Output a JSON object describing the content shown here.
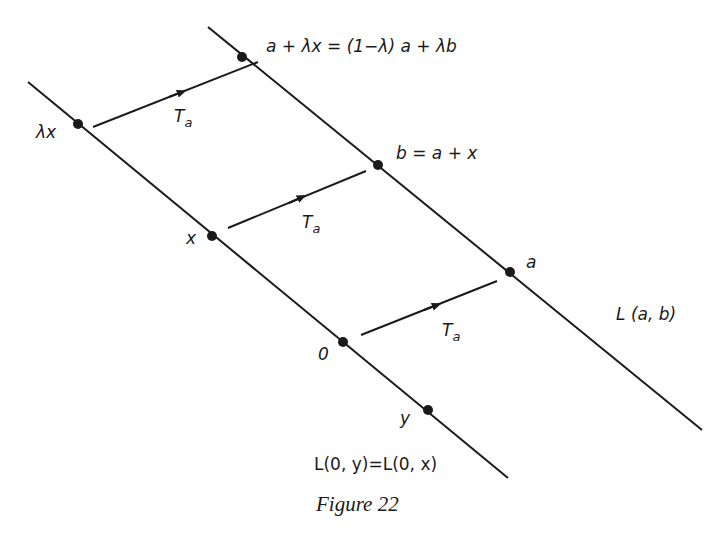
{
  "diagram": {
    "caption": "Figure 22",
    "colors": {
      "ink": "#1a1a1a",
      "background": "#ffffff"
    },
    "lines": [
      {
        "id": "line-0x",
        "label": "L(0,y)=L(0,x)",
        "from": [
          28,
          82
        ],
        "to": [
          508,
          478
        ]
      },
      {
        "id": "line-ab",
        "label": "L(a,b)",
        "from": [
          208,
          27
        ],
        "to": [
          702,
          430
        ]
      }
    ],
    "points": [
      {
        "id": "lambda-x",
        "label": "λx",
        "x": 78,
        "y": 124
      },
      {
        "id": "x",
        "label": "x",
        "x": 212,
        "y": 236
      },
      {
        "id": "origin",
        "label": "0",
        "x": 343,
        "y": 342
      },
      {
        "id": "y",
        "label": "y",
        "x": 428,
        "y": 410
      },
      {
        "id": "a-plus-lambda-x",
        "label": "a + λx = (1−λ) a + λb",
        "x": 242,
        "y": 57
      },
      {
        "id": "b",
        "label": "b = a + x",
        "x": 378,
        "y": 165
      },
      {
        "id": "a",
        "label": "a",
        "x": 510,
        "y": 272
      }
    ],
    "arrows": [
      {
        "id": "translation-top",
        "label_main": "T",
        "label_sub": "a",
        "from": [
          93,
          127
        ],
        "to": [
          258,
          62
        ]
      },
      {
        "id": "translation-middle",
        "label_main": "T",
        "label_sub": "a",
        "from": [
          228,
          228
        ],
        "to": [
          366,
          171
        ]
      },
      {
        "id": "translation-bottom",
        "label_main": "T",
        "label_sub": "a",
        "from": [
          361,
          335
        ],
        "to": [
          497,
          281
        ]
      }
    ],
    "labels": {
      "lambda_x": "λx",
      "x": "x",
      "origin": "0",
      "y": "y",
      "a_plus_lambda_x": "a + λx = (1−λ) a + λb",
      "b_eq": "b = a + x",
      "a": "a",
      "line_ab": "L (a, b)",
      "line_0y": "L(0, y)=L(0, x)",
      "T": "T",
      "a_sub": "a"
    }
  }
}
